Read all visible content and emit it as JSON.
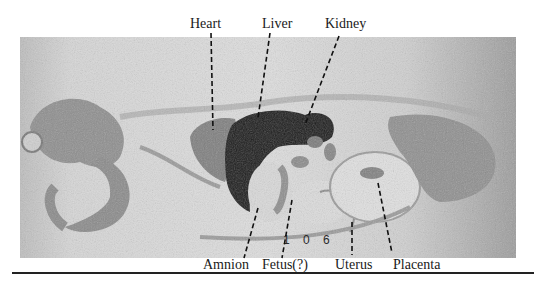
{
  "figure": {
    "plate_number": "1 0 6",
    "top_labels": [
      {
        "id": "heart",
        "text": "Heart"
      },
      {
        "id": "liver",
        "text": "Liver"
      },
      {
        "id": "kidney",
        "text": "Kidney"
      }
    ],
    "bottom_labels": [
      {
        "id": "amnion",
        "text": "Amnion"
      },
      {
        "id": "fetus",
        "text": "Fetus(?)"
      },
      {
        "id": "uterus",
        "text": "Uterus"
      },
      {
        "id": "placenta",
        "text": "Placenta"
      }
    ],
    "colors": {
      "background": "#ffffff",
      "photo_base": "#c9c9c9",
      "tissue_mid": "#8f8f8f",
      "tissue_dark": "#1c1c1c",
      "text": "#1a1a1a"
    }
  }
}
